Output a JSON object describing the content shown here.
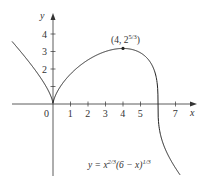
{
  "chart_data": {
    "type": "line",
    "title": "",
    "function": "y = x^(2/3) (6 - x)^(1/3)",
    "xlabel": "x",
    "ylabel": "y",
    "xlim": [
      -2.34,
      7.6
    ],
    "ylim": [
      -4.1,
      5.0
    ],
    "grid": false,
    "x_ticks": [
      1,
      2,
      3,
      4,
      5,
      7
    ],
    "x_tick_labels": [
      "1",
      "2",
      "3",
      "4",
      "5",
      "7"
    ],
    "y_ticks": [
      1,
      2,
      3,
      4
    ],
    "y_tick_labels": [
      "",
      "2",
      "3",
      "4"
    ],
    "origin_label": "0",
    "series": [
      {
        "name": "y = x^(2/3)(6 − x)^(1/3)",
        "x_range": [
          -2.34,
          7.26
        ]
      }
    ],
    "key_points": [
      {
        "x": 4,
        "y": 3.1748,
        "label": "(4, 2^(5/3))",
        "marker": true
      },
      {
        "x": 0,
        "y": 0,
        "note": "cusp"
      },
      {
        "x": 6,
        "y": 0,
        "note": "vertical tangent"
      }
    ],
    "annotations": {
      "max_point": {
        "base": "(4, 2",
        "exp": "5/3",
        "close": ")"
      },
      "equation": {
        "pre": "y = x",
        "exp1": "2/3",
        "mid": "(6 − x)",
        "exp2": "1/3"
      }
    }
  },
  "layout": {
    "origin_px": [
      53,
      104
    ],
    "unit_px": 17.5,
    "line_color": "#222222",
    "axis_color": "#333333"
  }
}
